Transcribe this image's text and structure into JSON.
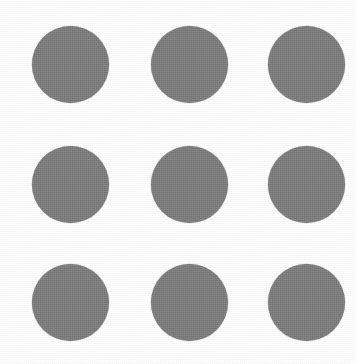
{
  "image": {
    "title": "Gray Dot Grid",
    "description": "A 3 by 3 grid of nine solid medium-gray filled circles on a white background",
    "width": 356,
    "height": 364,
    "background_color": "#fefefe",
    "texture": "fine scan noise"
  },
  "grid": {
    "rows": 3,
    "columns": 3,
    "total_shapes": 9,
    "shape_type": "circle",
    "fill_color": "#7f7f7f",
    "stroke": "none",
    "diameter_px": 77,
    "column_centers_px": [
      70,
      189,
      306
    ],
    "row_centers_px": [
      64,
      184,
      302
    ],
    "column_spacing_px": 118,
    "row_spacing_px": 119,
    "margins_px": {
      "top": 24,
      "right": 12,
      "bottom": 21,
      "left": 32
    }
  },
  "shapes": [
    {
      "id": "dot-r1-c1",
      "row": 1,
      "col": 1,
      "cx": 70,
      "cy": 64,
      "r": 38.5,
      "color": "#7f7f7f",
      "label": "circle row 1 column 1"
    },
    {
      "id": "dot-r1-c2",
      "row": 1,
      "col": 2,
      "cx": 189,
      "cy": 64,
      "r": 38.5,
      "color": "#7f7f7f",
      "label": "circle row 1 column 2"
    },
    {
      "id": "dot-r1-c3",
      "row": 1,
      "col": 3,
      "cx": 306,
      "cy": 64,
      "r": 38.5,
      "color": "#7f7f7f",
      "label": "circle row 1 column 3"
    },
    {
      "id": "dot-r2-c1",
      "row": 2,
      "col": 1,
      "cx": 70,
      "cy": 184,
      "r": 38.5,
      "color": "#7f7f7f",
      "label": "circle row 2 column 1"
    },
    {
      "id": "dot-r2-c2",
      "row": 2,
      "col": 2,
      "cx": 189,
      "cy": 184,
      "r": 38.5,
      "color": "#7f7f7f",
      "label": "circle row 2 column 2"
    },
    {
      "id": "dot-r2-c3",
      "row": 2,
      "col": 3,
      "cx": 306,
      "cy": 184,
      "r": 38.5,
      "color": "#7f7f7f",
      "label": "circle row 2 column 3"
    },
    {
      "id": "dot-r3-c1",
      "row": 3,
      "col": 1,
      "cx": 70,
      "cy": 302,
      "r": 38.5,
      "color": "#7f7f7f",
      "label": "circle row 3 column 1"
    },
    {
      "id": "dot-r3-c2",
      "row": 3,
      "col": 2,
      "cx": 189,
      "cy": 302,
      "r": 38.5,
      "color": "#7f7f7f",
      "label": "circle row 3 column 2"
    },
    {
      "id": "dot-r3-c3",
      "row": 3,
      "col": 3,
      "cx": 306,
      "cy": 302,
      "r": 38.5,
      "color": "#7f7f7f",
      "label": "circle row 3 column 3"
    }
  ]
}
